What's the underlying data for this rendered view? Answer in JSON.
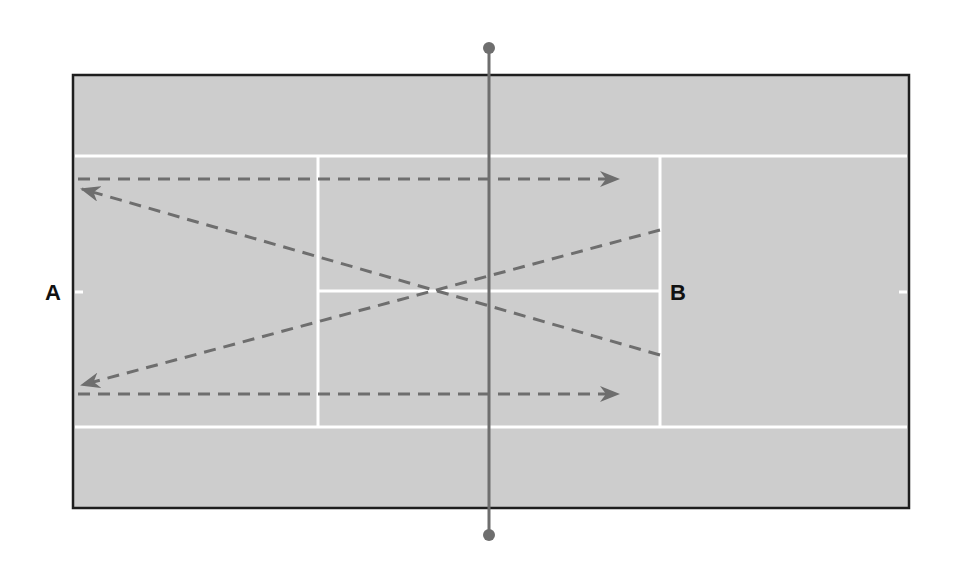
{
  "diagram": {
    "type": "tennis-court-drill",
    "colors": {
      "background": "#ffffff",
      "court_surface": "#cdcdcd",
      "court_border": "#1e1e1e",
      "court_lines": "#ffffff",
      "net": "#6e6e6e",
      "shot_path": "#6e6e6e",
      "label_text": "#111111"
    },
    "labels": {
      "player_a": "A",
      "player_b": "B"
    },
    "court": {
      "outer": {
        "x1": 73,
        "y1": 75,
        "x2": 909,
        "y2": 508
      },
      "singles_top_y": 156,
      "singles_bottom_y": 427,
      "service_line_left_x": 318,
      "service_line_right_x": 660,
      "center_service_line_y": 291,
      "center_marks": [
        {
          "x": 78,
          "y": 292
        },
        {
          "x": 904,
          "y": 292
        }
      ]
    },
    "net": {
      "x": 489,
      "top_post_y": 48,
      "bottom_post_y": 535,
      "post_radius": 6
    },
    "shots": [
      {
        "name": "top-straight-shot",
        "from": [
          78,
          179
        ],
        "to": [
          618,
          179
        ],
        "direction": "right"
      },
      {
        "name": "bottom-straight-shot",
        "from": [
          78,
          394
        ],
        "to": [
          618,
          394
        ],
        "direction": "right"
      },
      {
        "name": "cross-shot-to-top-left",
        "from": [
          660,
          355
        ],
        "to": [
          82,
          189
        ],
        "direction": "left"
      },
      {
        "name": "cross-shot-to-bottom-left",
        "from": [
          660,
          230
        ],
        "to": [
          82,
          385
        ],
        "direction": "left"
      }
    ]
  }
}
